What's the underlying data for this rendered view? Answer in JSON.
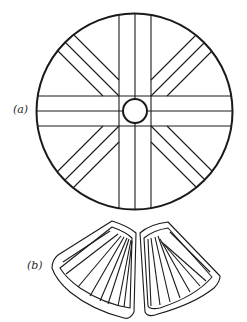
{
  "figure": {
    "labels": {
      "a": "(a)",
      "b": "(b)"
    },
    "colors": {
      "stroke": "#1a1a1a",
      "background": "#ffffff"
    },
    "part_a": {
      "description": "Circular disc with central hub and eight radiating strip pairs",
      "outer_circle": {
        "cx": 134.5,
        "cy": 111.5,
        "r": 98
      },
      "hub_circle": {
        "cx": 135,
        "cy": 111,
        "r": 12
      },
      "vertical_strip_x": [
        119,
        135,
        151
      ],
      "horizontal_strip_y": [
        96,
        111,
        126
      ],
      "diagonal_strips": 4
    },
    "part_b": {
      "description": "Two fan-shaped pleated halves with border bands, joined at top center"
    }
  }
}
